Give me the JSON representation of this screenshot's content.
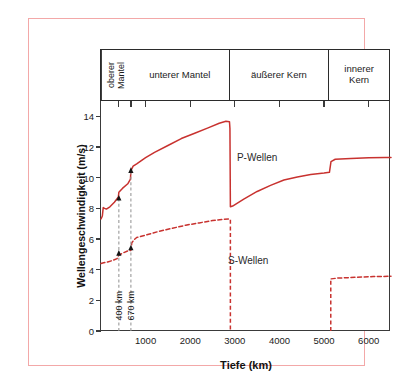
{
  "figure": {
    "border_color": "#f3a8a8",
    "curve_color": "#c8322f",
    "annotation_color": "#9a9a9a"
  },
  "layers": [
    {
      "label": "oberer\nMantel",
      "orientation": "vertical",
      "from_km": 0,
      "to_km": 670
    },
    {
      "label": "unterer Mantel",
      "orientation": "horizontal",
      "from_km": 670,
      "to_km": 2900
    },
    {
      "label": "äußerer Kern",
      "orientation": "horizontal",
      "from_km": 2900,
      "to_km": 5150
    },
    {
      "label": "innerer\nKern",
      "orientation": "horizontal",
      "from_km": 5150,
      "to_km": 6500
    }
  ],
  "annotations": [
    {
      "name": "boundary-400",
      "label": "400 km",
      "depth_km": 400
    },
    {
      "name": "boundary-670",
      "label": "670 km",
      "depth_km": 670
    }
  ],
  "chart_data": {
    "type": "line",
    "title": "",
    "xlabel": "Tiefe (km)",
    "ylabel": "Wellengeschwindigkeit (m/s)",
    "xlim": [
      0,
      6500
    ],
    "ylim": [
      0,
      15
    ],
    "xticks": [
      1000,
      2000,
      3000,
      4000,
      5000,
      6000
    ],
    "yticks": [
      0,
      2,
      4,
      6,
      8,
      10,
      12,
      14
    ],
    "grid": false,
    "legend": "inline-labels",
    "series": [
      {
        "name": "P-Wellen",
        "style": "solid",
        "color": "#c8322f",
        "label_x_km": 3500,
        "label_y": 11.3,
        "points": [
          [
            0,
            7.3
          ],
          [
            30,
            7.5
          ],
          [
            50,
            8.05
          ],
          [
            80,
            8.0
          ],
          [
            120,
            7.95
          ],
          [
            200,
            8.1
          ],
          [
            300,
            8.4
          ],
          [
            390,
            8.75
          ],
          [
            400,
            9.05
          ],
          [
            480,
            9.3
          ],
          [
            600,
            9.6
          ],
          [
            660,
            9.9
          ],
          [
            670,
            10.45
          ],
          [
            720,
            10.75
          ],
          [
            800,
            10.9
          ],
          [
            1000,
            11.3
          ],
          [
            1200,
            11.65
          ],
          [
            1500,
            12.1
          ],
          [
            1800,
            12.55
          ],
          [
            2100,
            12.9
          ],
          [
            2400,
            13.25
          ],
          [
            2650,
            13.55
          ],
          [
            2800,
            13.68
          ],
          [
            2880,
            13.65
          ],
          [
            2890,
            13.2
          ],
          [
            2900,
            8.1
          ],
          [
            2950,
            8.15
          ],
          [
            3200,
            8.6
          ],
          [
            3500,
            9.1
          ],
          [
            3800,
            9.5
          ],
          [
            4100,
            9.85
          ],
          [
            4400,
            10.05
          ],
          [
            4700,
            10.2
          ],
          [
            5000,
            10.3
          ],
          [
            5120,
            10.35
          ],
          [
            5155,
            11.05
          ],
          [
            5250,
            11.2
          ],
          [
            5600,
            11.25
          ],
          [
            6000,
            11.3
          ],
          [
            6371,
            11.32
          ],
          [
            6500,
            11.32
          ]
        ]
      },
      {
        "name": "S-Wellen",
        "style": "dashed",
        "color": "#c8322f",
        "label_x_km": 3300,
        "label_y": 4.55,
        "points": [
          [
            0,
            4.4
          ],
          [
            60,
            4.45
          ],
          [
            150,
            4.5
          ],
          [
            260,
            4.6
          ],
          [
            360,
            4.72
          ],
          [
            400,
            4.95
          ],
          [
            500,
            5.1
          ],
          [
            620,
            5.25
          ],
          [
            670,
            5.25
          ],
          [
            690,
            5.75
          ],
          [
            740,
            5.95
          ],
          [
            800,
            6.1
          ],
          [
            1000,
            6.25
          ],
          [
            1300,
            6.5
          ],
          [
            1600,
            6.7
          ],
          [
            1900,
            6.9
          ],
          [
            2200,
            7.05
          ],
          [
            2500,
            7.2
          ],
          [
            2750,
            7.28
          ],
          [
            2860,
            7.3
          ],
          [
            2890,
            7.25
          ],
          [
            2900,
            0
          ],
          [
            5150,
            0
          ],
          [
            5160,
            3.4
          ],
          [
            5300,
            3.45
          ],
          [
            5700,
            3.5
          ],
          [
            6100,
            3.55
          ],
          [
            6500,
            3.57
          ]
        ]
      }
    ]
  }
}
